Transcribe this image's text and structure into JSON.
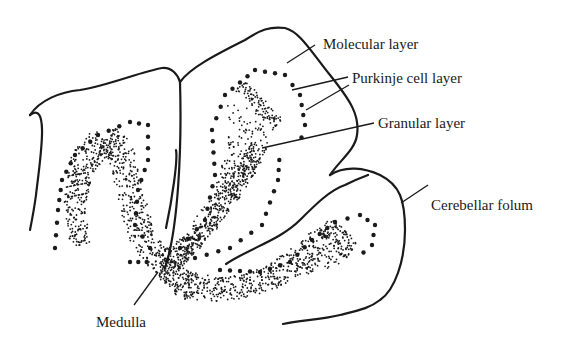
{
  "diagram": {
    "labels": [
      {
        "id": "molecular",
        "text": "Molecular layer",
        "x": 323,
        "y": 37
      },
      {
        "id": "purkinje",
        "text": "Purkinje cell layer",
        "x": 352,
        "y": 71
      },
      {
        "id": "granular",
        "text": "Granular layer",
        "x": 378,
        "y": 115
      },
      {
        "id": "folium",
        "text": "Cerebellar folum",
        "x": 431,
        "y": 198
      },
      {
        "id": "medulla",
        "text": "Medulla",
        "x": 96,
        "y": 315
      }
    ],
    "colors": {
      "ink": "#1a1a1a",
      "background": "#ffffff"
    }
  }
}
